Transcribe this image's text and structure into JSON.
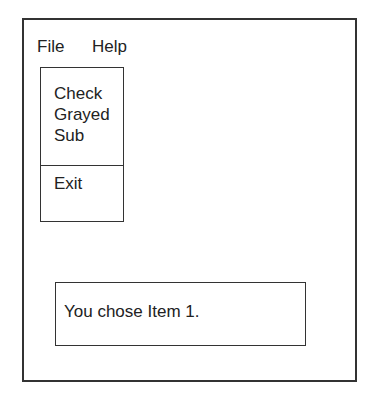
{
  "menubar": {
    "items": [
      {
        "label": "File"
      },
      {
        "label": "Help"
      }
    ]
  },
  "file_menu": {
    "items": [
      {
        "label": "Check"
      },
      {
        "label": "Grayed"
      },
      {
        "label": "Sub"
      },
      {
        "label": "Exit"
      }
    ]
  },
  "message": {
    "text": "You chose Item 1."
  }
}
